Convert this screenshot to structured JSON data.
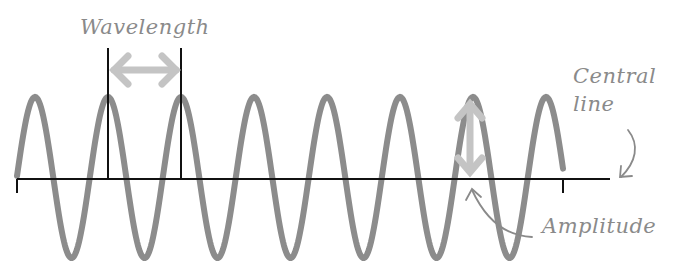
{
  "diagram": {
    "type": "transverse-wave",
    "labels": {
      "wavelength": "Wavelength",
      "central_line_1": "Central",
      "central_line_2": "line",
      "amplitude": "Amplitude"
    },
    "colors": {
      "wave": "#8c8c8c",
      "axis": "#111111",
      "arrow": "#c4c4c4",
      "label": "#8a8a8a"
    },
    "wave": {
      "start_x": 17,
      "end_x": 563,
      "baseline_y": 179,
      "peak_y": 97,
      "trough_y": 258,
      "period_px": 73,
      "cycles": 7.5
    }
  }
}
